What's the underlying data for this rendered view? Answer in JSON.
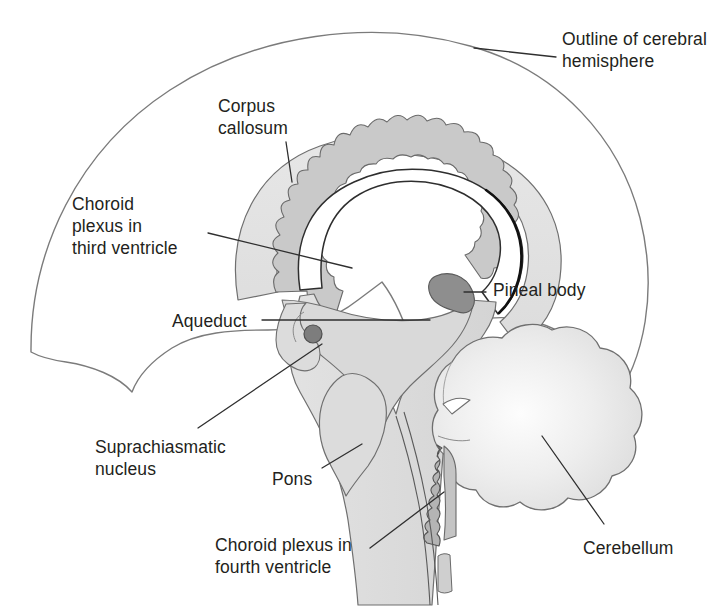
{
  "figure": {
    "width": 722,
    "height": 608,
    "background": "#ffffff",
    "text_color": "#231f20",
    "leader_line_color": "#3a3a3a",
    "outline_color": "#7b7b7b"
  },
  "labels": {
    "cerebral_outline": "Outline of cerebral\nhemisphere",
    "corpus_callosum": "Corpus\ncallosum",
    "choroid_third": "Choroid\nplexus in\nthird ventricle",
    "aqueduct": "Aqueduct",
    "pineal_body": "Pineal body",
    "suprachiasmatic": "Suprachiasmatic\nnucleus",
    "pons": "Pons",
    "choroid_fourth": "Choroid plexus in\nfourth ventricle",
    "cerebellum": "Cerebellum"
  },
  "structures": {
    "cerebral_hemisphere": {
      "name": "Outline of cerebral hemisphere",
      "fill": "none",
      "stroke": "#7b7b7b"
    },
    "corpus_callosum": {
      "name": "Corpus callosum",
      "fill": "#e3e3e3",
      "stroke": "#6f6f6f"
    },
    "choroid_plexus_third_ventricle": {
      "name": "Choroid plexus in third ventricle",
      "fill": "#c9c9c9",
      "stroke": "#6f6f6f"
    },
    "lateral_ventricle": {
      "name": "Lateral ventricle",
      "fill": "#ffffff",
      "stroke": "#3a3a3a"
    },
    "thalamus_brainstem": {
      "name": "Brainstem and diencephalon",
      "fill": "#dcdcdc",
      "stroke": "#6f6f6f"
    },
    "pineal_body": {
      "name": "Pineal body",
      "fill": "#8e8e8e",
      "stroke": "#5a5a5a"
    },
    "aqueduct": {
      "name": "Cerebral aqueduct",
      "fill": "#7d7d7d",
      "stroke": "#545454"
    },
    "pons": {
      "name": "Pons",
      "fill": "#dcdcdc",
      "stroke": "#6f6f6f"
    },
    "medulla": {
      "name": "Medulla oblongata",
      "fill": "#dcdcdc",
      "stroke": "#6f6f6f"
    },
    "cerebellum": {
      "name": "Cerebellum",
      "fill": "#e8e8e8",
      "stroke": "#6f6f6f"
    },
    "choroid_plexus_fourth_ventricle": {
      "name": "Choroid plexus in fourth ventricle",
      "fill": "#b4b4b4",
      "stroke": "#5a5a5a"
    },
    "optic_chiasm": {
      "name": "Optic chiasm",
      "fill": "#dcdcdc",
      "stroke": "#6f6f6f"
    }
  },
  "label_positions": {
    "cerebral_outline": {
      "x": 562,
      "y": 28,
      "align": "left"
    },
    "corpus_callosum": {
      "x": 218,
      "y": 95,
      "align": "left"
    },
    "choroid_third": {
      "x": 72,
      "y": 193,
      "align": "left"
    },
    "aqueduct": {
      "x": 172,
      "y": 310,
      "align": "left"
    },
    "pineal_body": {
      "x": 493,
      "y": 279,
      "align": "left"
    },
    "suprachiasmatic": {
      "x": 95,
      "y": 436,
      "align": "left"
    },
    "pons": {
      "x": 272,
      "y": 468,
      "align": "left"
    },
    "choroid_fourth": {
      "x": 215,
      "y": 534,
      "align": "left"
    },
    "cerebellum": {
      "x": 583,
      "y": 537,
      "align": "left"
    }
  }
}
